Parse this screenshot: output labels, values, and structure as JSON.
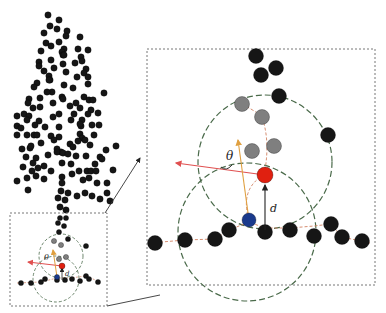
{
  "colors": {
    "point": "#161616",
    "gray_point": "#7f7f7f",
    "red_point": "#e02010",
    "blue_point": "#1a3a8c",
    "frame": "#777777",
    "circle": "#4a6a4a",
    "red_arrow": "#e05050",
    "orange_arrow": "#e0a040",
    "dashed_path": "#d08060",
    "d_arrow": "#222222"
  },
  "labels": {
    "theta": "θ",
    "distance": "d"
  },
  "tree": {
    "radius": 3.2,
    "points": [
      [
        48,
        15
      ],
      [
        59,
        20
      ],
      [
        50,
        26
      ],
      [
        57,
        29
      ],
      [
        44,
        33
      ],
      [
        67,
        31
      ],
      [
        66,
        36
      ],
      [
        46,
        43
      ],
      [
        59,
        42
      ],
      [
        80,
        37
      ],
      [
        51,
        46
      ],
      [
        64,
        49
      ],
      [
        41,
        51
      ],
      [
        62,
        52
      ],
      [
        78,
        49
      ],
      [
        88,
        50
      ],
      [
        63,
        55
      ],
      [
        64,
        55
      ],
      [
        81,
        57
      ],
      [
        39,
        62
      ],
      [
        51,
        60
      ],
      [
        63,
        64
      ],
      [
        75,
        63
      ],
      [
        39,
        66
      ],
      [
        82,
        61
      ],
      [
        44,
        71
      ],
      [
        54,
        68
      ],
      [
        86,
        69
      ],
      [
        66,
        72
      ],
      [
        84,
        73
      ],
      [
        49,
        76
      ],
      [
        77,
        77
      ],
      [
        50,
        80
      ],
      [
        88,
        77
      ],
      [
        37,
        83
      ],
      [
        34,
        87
      ],
      [
        49,
        80
      ],
      [
        88,
        84
      ],
      [
        64,
        85
      ],
      [
        73,
        88
      ],
      [
        52,
        92
      ],
      [
        47,
        92
      ],
      [
        29,
        99
      ],
      [
        40,
        98
      ],
      [
        62,
        97
      ],
      [
        84,
        97
      ],
      [
        63,
        99
      ],
      [
        104,
        93
      ],
      [
        28,
        103
      ],
      [
        53,
        103
      ],
      [
        76,
        103
      ],
      [
        89,
        100
      ],
      [
        93,
        100
      ],
      [
        40,
        107
      ],
      [
        33,
        108
      ],
      [
        70,
        106
      ],
      [
        80,
        108
      ],
      [
        91,
        110
      ],
      [
        59,
        114
      ],
      [
        74,
        114
      ],
      [
        88,
        114
      ],
      [
        98,
        113
      ],
      [
        17,
        116
      ],
      [
        24,
        114
      ],
      [
        53,
        117
      ],
      [
        39,
        121
      ],
      [
        71,
        120
      ],
      [
        82,
        120
      ],
      [
        29,
        116
      ],
      [
        27,
        120
      ],
      [
        17,
        126
      ],
      [
        35,
        125
      ],
      [
        21,
        128
      ],
      [
        45,
        127
      ],
      [
        59,
        127
      ],
      [
        81,
        126
      ],
      [
        92,
        125
      ],
      [
        99,
        125
      ],
      [
        80,
        124
      ],
      [
        27,
        135
      ],
      [
        17,
        135
      ],
      [
        34,
        135
      ],
      [
        37,
        135
      ],
      [
        51,
        136
      ],
      [
        59,
        137
      ],
      [
        80,
        134
      ],
      [
        82,
        138
      ],
      [
        94,
        135
      ],
      [
        41,
        143
      ],
      [
        54,
        140
      ],
      [
        70,
        144
      ],
      [
        78,
        141
      ],
      [
        85,
        140
      ],
      [
        90,
        145
      ],
      [
        22,
        149
      ],
      [
        30,
        148
      ],
      [
        31,
        146
      ],
      [
        57,
        149
      ],
      [
        61,
        152
      ],
      [
        73,
        147
      ],
      [
        106,
        150
      ],
      [
        116,
        146
      ],
      [
        26,
        157
      ],
      [
        36,
        158
      ],
      [
        48,
        155
      ],
      [
        57,
        152
      ],
      [
        63,
        153
      ],
      [
        68,
        154
      ],
      [
        76,
        156
      ],
      [
        86,
        156
      ],
      [
        100,
        157
      ],
      [
        102,
        159
      ],
      [
        33,
        163
      ],
      [
        44,
        166
      ],
      [
        23,
        167
      ],
      [
        38,
        168
      ],
      [
        32,
        171
      ],
      [
        51,
        171
      ],
      [
        62,
        163
      ],
      [
        71,
        164
      ],
      [
        79,
        171
      ],
      [
        87,
        171
      ],
      [
        95,
        164
      ],
      [
        91,
        171
      ],
      [
        96,
        171
      ],
      [
        113,
        170
      ],
      [
        17,
        181
      ],
      [
        27,
        178
      ],
      [
        36,
        176
      ],
      [
        44,
        179
      ],
      [
        62,
        177
      ],
      [
        72,
        174
      ],
      [
        62,
        183
      ],
      [
        83,
        180
      ],
      [
        89,
        178
      ],
      [
        97,
        183
      ],
      [
        107,
        183
      ],
      [
        28,
        190
      ],
      [
        61,
        191
      ],
      [
        68,
        193
      ],
      [
        77,
        196
      ],
      [
        85,
        193
      ],
      [
        92,
        196
      ],
      [
        100,
        199
      ],
      [
        107,
        193
      ],
      [
        110,
        201
      ],
      [
        58,
        198
      ],
      [
        65,
        200
      ],
      [
        60,
        207
      ],
      [
        66,
        210
      ]
    ]
  },
  "inset": {
    "box": {
      "x": 10,
      "y": 213,
      "w": 97,
      "h": 93
    },
    "arrow_top": {
      "x1": 105,
      "y1": 213,
      "x2": 140,
      "y2": 158
    },
    "arrow_bottom": {
      "x1": 107,
      "y1": 306,
      "x2": 160,
      "y2": 295
    }
  },
  "detail": {
    "box": {
      "x": 147,
      "y": 49,
      "w": 228,
      "h": 236
    },
    "circle_upper": {
      "cx": 265,
      "cy": 162,
      "r": 67
    },
    "circle_lower": {
      "cx": 247,
      "cy": 232,
      "r": 69
    },
    "point_radius": 7.5,
    "black_points": [
      [
        256,
        56
      ],
      [
        261,
        75
      ],
      [
        276,
        68
      ],
      [
        279,
        96
      ],
      [
        328,
        135
      ],
      [
        155,
        243
      ],
      [
        185,
        240
      ],
      [
        215,
        239
      ],
      [
        229,
        230
      ],
      [
        265,
        232
      ],
      [
        290,
        230
      ],
      [
        314,
        236
      ],
      [
        331,
        224
      ],
      [
        342,
        237
      ],
      [
        362,
        241
      ]
    ],
    "gray_points": [
      [
        242,
        104
      ],
      [
        262,
        117
      ],
      [
        252,
        151
      ],
      [
        274,
        146
      ]
    ],
    "red_point": [
      265,
      175
    ],
    "blue_point": [
      249,
      220
    ],
    "baseline_path": "M150,243 L185,240 L215,239 L229,230 L249,222 L265,228 L290,228 L314,226 L331,224 L342,237 L370,243",
    "upper_path": "M242,104 Q262,115 262,117 Q270,140 265,170",
    "blue_to_red_path": "M249,220 Q240,190 262,176",
    "red_arrow": {
      "x1": 265,
      "y1": 175,
      "x2": 176,
      "y2": 163
    },
    "orange_arrow": {
      "x1": 249,
      "y1": 220,
      "x2": 238,
      "y2": 140
    },
    "d_arrow": {
      "x1": 265,
      "y1": 230,
      "x2": 265,
      "y2": 185
    },
    "theta_label_pos": [
      226,
      160
    ],
    "d_label_pos": [
      270,
      212
    ],
    "theta_arc": "M221,167 Q226,172 232,165"
  },
  "inset_detail": {
    "circle_upper": {
      "cx": 61,
      "cy": 256,
      "r": 22
    },
    "circle_lower": {
      "cx": 56,
      "cy": 279,
      "r": 23
    },
    "point_radius": 2.6,
    "black_points": [
      [
        60,
        218
      ],
      [
        66,
        218
      ],
      [
        58,
        223
      ],
      [
        64,
        226
      ],
      [
        59,
        232
      ],
      [
        68,
        239
      ],
      [
        86,
        246
      ],
      [
        21,
        283
      ],
      [
        31,
        283
      ],
      [
        41,
        282
      ],
      [
        45,
        279
      ],
      [
        57,
        280
      ],
      [
        65,
        280
      ],
      [
        72,
        279
      ],
      [
        80,
        281
      ],
      [
        86,
        276
      ],
      [
        89,
        279
      ],
      [
        98,
        282
      ]
    ],
    "gray_points": [
      [
        54,
        241
      ],
      [
        61,
        245
      ],
      [
        59,
        259
      ],
      [
        66,
        257
      ]
    ],
    "red_point": [
      62,
      266
    ],
    "blue_point": [
      57,
      277
    ],
    "baseline_path": "M17,283 L41,282 L57,278 L70,278 L86,276 L100,282",
    "red_arrow": {
      "x1": 62,
      "y1": 266,
      "x2": 28,
      "y2": 262
    },
    "orange_arrow": {
      "x1": 57,
      "y1": 277,
      "x2": 53,
      "y2": 250
    },
    "d_arrow": {
      "x1": 62,
      "y1": 280,
      "x2": 62,
      "y2": 268
    },
    "theta_label_pos": [
      44,
      260
    ],
    "d_label_pos": [
      65,
      276
    ]
  }
}
